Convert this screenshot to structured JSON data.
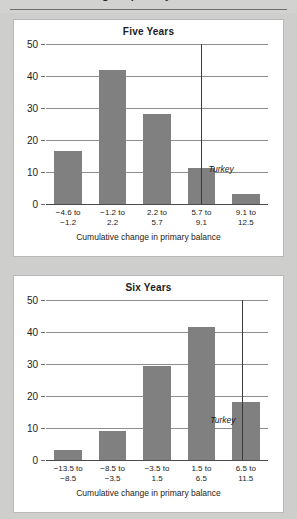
{
  "page": {
    "background_color": "#cececc",
    "panel_background": "#ffffff",
    "clipped_header_text": "Cumulative change in primary balance"
  },
  "chart_data": [
    {
      "type": "bar",
      "title": "Five Years",
      "xlabel": "Cumulative change in primary balance",
      "ylabel": "",
      "categories": [
        "−4.6 to −1.2",
        "−1.2 to 2.2",
        "2.2 to 5.7",
        "5.7 to 9.1",
        "9.1 to 12.5"
      ],
      "category_lines": [
        [
          "−4.6 to",
          "−1.2"
        ],
        [
          "−1.2 to",
          "2.2"
        ],
        [
          "2.2 to",
          "5.7"
        ],
        [
          "5.7 to",
          "9.1"
        ],
        [
          "9.1 to",
          "12.5"
        ]
      ],
      "values": [
        16.5,
        42.0,
        28.0,
        11.3,
        3.0
      ],
      "ylim": [
        0,
        50
      ],
      "yticks": [
        0,
        10,
        20,
        30,
        40,
        50
      ],
      "grid": true,
      "bar_color": "#808080",
      "annotations": [
        {
          "label": "Turkey",
          "value": 7.0,
          "position_fraction": 0.7,
          "label_side": "right"
        }
      ]
    },
    {
      "type": "bar",
      "title": "Six Years",
      "xlabel": "Cumulative change in primary balance",
      "ylabel": "",
      "categories": [
        "−13.5 to −8.5",
        "−8.5 to −3.5",
        "−3.5 to 1.5",
        "1.5 to 6.5",
        "6.5 to 11.5"
      ],
      "category_lines": [
        [
          "−13.5 to",
          "−8.5"
        ],
        [
          "−8.5 to",
          "−3.5"
        ],
        [
          "−3.5 to",
          "1.5"
        ],
        [
          "1.5 to",
          "6.5"
        ],
        [
          "6.5 to",
          "11.5"
        ]
      ],
      "values": [
        3.0,
        9.0,
        29.5,
        41.5,
        18.0
      ],
      "ylim": [
        0,
        50
      ],
      "yticks": [
        0,
        10,
        20,
        30,
        40,
        50
      ],
      "grid": true,
      "bar_color": "#808080",
      "annotations": [
        {
          "label": "Turkey",
          "value": 8.5,
          "position_fraction": 0.885,
          "label_side": "left"
        }
      ]
    }
  ]
}
